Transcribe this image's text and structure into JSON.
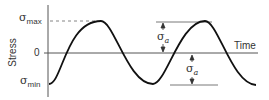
{
  "diagram": {
    "title": "",
    "y_axis_label": "Stress",
    "x_axis_label": "Time",
    "y_ticks": {
      "max": {
        "symbol": "σ",
        "subscript": "max"
      },
      "zero": "0",
      "min": {
        "symbol": "σ",
        "subscript": "min"
      }
    },
    "amplitude_annotations": [
      {
        "symbol": "σ",
        "subscript": "a",
        "position": "upper",
        "from": "0",
        "to": "σmax"
      },
      {
        "symbol": "σ",
        "subscript": "a",
        "position": "lower",
        "from": "0",
        "to": "σmin"
      }
    ],
    "curve": {
      "type": "sinusoid",
      "start_phase": "minimum",
      "cycles_shown": 2,
      "color": "#111111"
    },
    "colors": {
      "axis": "#555555",
      "curve": "#111111",
      "dashed": "#666666",
      "text": "#333333"
    }
  }
}
